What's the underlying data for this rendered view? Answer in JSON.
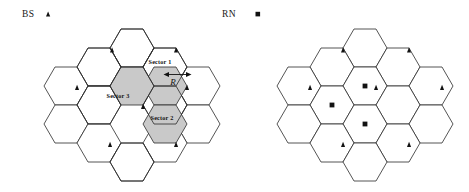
{
  "figure": {
    "title": "",
    "legend": [
      {
        "label": "BS",
        "marker": "triangle-icon",
        "name": "base-station"
      },
      {
        "label": "RN",
        "marker": "square-icon",
        "name": "relay-node"
      }
    ],
    "clusters": [
      {
        "name": "sectored-cell-cluster",
        "sectors": [
          {
            "label": "Sector 1"
          },
          {
            "label": "Sector 2"
          },
          {
            "label": "Sector 3"
          }
        ],
        "dimension": {
          "label": "R"
        }
      },
      {
        "name": "relay-node-cluster",
        "sectors": [],
        "dimension": {
          "label": ""
        }
      }
    ]
  }
}
